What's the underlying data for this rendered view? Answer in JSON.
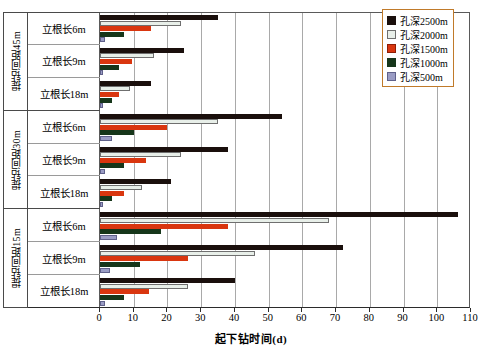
{
  "chart_data": {
    "type": "bar",
    "orientation": "horizontal",
    "title": "",
    "xlabel": "起下钻时间(d)",
    "ylabel": "",
    "xlim": [
      0,
      110
    ],
    "xticks": [
      0,
      10,
      20,
      30,
      40,
      50,
      60,
      70,
      80,
      90,
      100,
      110
    ],
    "xtick_labels": [
      "0",
      "10",
      "20",
      "30",
      "40",
      "50",
      "60",
      "70",
      "80",
      "90",
      "100",
      "110"
    ],
    "grid": true,
    "grid_axis": "x",
    "legend_position": "top-right",
    "legend": [
      "孔深2500m",
      "孔深2000m",
      "孔深1500m",
      "孔深1000m",
      "孔深500m"
    ],
    "series": [
      {
        "name": "孔深2500m",
        "color": "#1a0f0c",
        "values": [
          35,
          25,
          15,
          54,
          38,
          21,
          106,
          72,
          40
        ]
      },
      {
        "name": "孔深2000m",
        "color": "#e8efe9",
        "values": [
          24,
          16,
          9,
          35,
          24,
          12.5,
          68,
          46,
          26
        ]
      },
      {
        "name": "孔深1500m",
        "color": "#d9360f",
        "values": [
          15,
          9.5,
          5.5,
          20,
          13.5,
          7,
          38,
          26,
          14.5
        ]
      },
      {
        "name": "孔深1000m",
        "color": "#16361a",
        "values": [
          7,
          5.5,
          3.5,
          10,
          7,
          3.5,
          18,
          12,
          7
        ]
      },
      {
        "name": "孔深500m",
        "color": "#9a9cc4",
        "values": [
          1.5,
          1,
          0.8,
          3.5,
          1.5,
          0.8,
          5,
          3,
          1.5
        ]
      }
    ],
    "categories": [
      "提钻间距45m / 立根长6m",
      "提钻间距45m / 立根长9m",
      "提钻间距45m / 立根长18m",
      "提钻间距30m / 立根长6m",
      "提钻间距30m / 立根长9m",
      "提钻间距30m / 立根长18m",
      "提钻间距15m / 立根长6m",
      "提钻间距15m / 立根长9m",
      "提钻间距15m / 立根长18m"
    ],
    "groups": [
      {
        "label": "提钻间距45m",
        "rows": [
          "立根长6m",
          "立根长9m",
          "立根长18m"
        ]
      },
      {
        "label": "提钻间距30m",
        "rows": [
          "立根长6m",
          "立根长9m",
          "立根长18m"
        ]
      },
      {
        "label": "提钻间距15m",
        "rows": [
          "立根长6m",
          "立根长9m",
          "立根长18m"
        ]
      }
    ]
  }
}
